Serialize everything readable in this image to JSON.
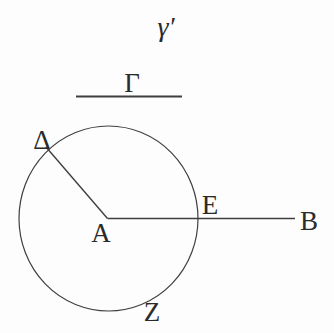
{
  "figure": {
    "type": "geometry-diagram",
    "colors": {
      "background": "#fdfdfd",
      "stroke": "#3f3f3f",
      "text": "#2b2b2b"
    },
    "labels": {
      "gamma_prime": "γ′",
      "Gamma": "Γ",
      "Delta": "Δ",
      "A": "A",
      "E": "E",
      "B": "B",
      "Z": "Z"
    }
  }
}
